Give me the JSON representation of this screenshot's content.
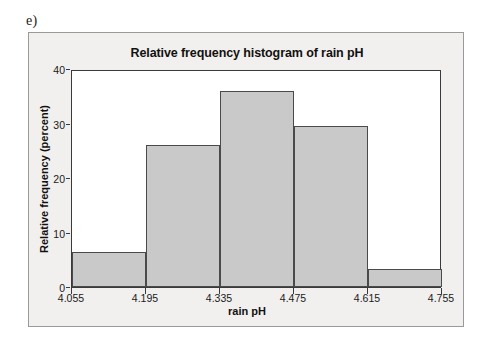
{
  "figure": {
    "part_label": "e)",
    "panel_background": "#f1f0ee",
    "plot_background": "#ffffff",
    "bar_fill": "#c9c9c9",
    "bar_stroke": "#4a4a4a"
  },
  "chart_data": {
    "type": "bar",
    "title": "Relative frequency histogram of rain pH",
    "xlabel": "rain pH",
    "ylabel": "Relative frequency (percent)",
    "grid": false,
    "legend": null,
    "xlim": [
      4.055,
      4.755
    ],
    "ylim": [
      0,
      40
    ],
    "xticks": [
      "4.055",
      "4.195",
      "4.335",
      "4.475",
      "4.615",
      "4.755"
    ],
    "yticks": [
      "0",
      "10",
      "20",
      "30",
      "40"
    ],
    "bin_width": 0.14,
    "bin_edges": [
      4.055,
      4.195,
      4.335,
      4.475,
      4.615,
      4.755
    ],
    "categories": [
      "4.055-4.195",
      "4.195-4.335",
      "4.335-4.475",
      "4.475-4.615",
      "4.615-4.755"
    ],
    "values": [
      6.5,
      26.0,
      36.0,
      29.5,
      3.3
    ]
  }
}
